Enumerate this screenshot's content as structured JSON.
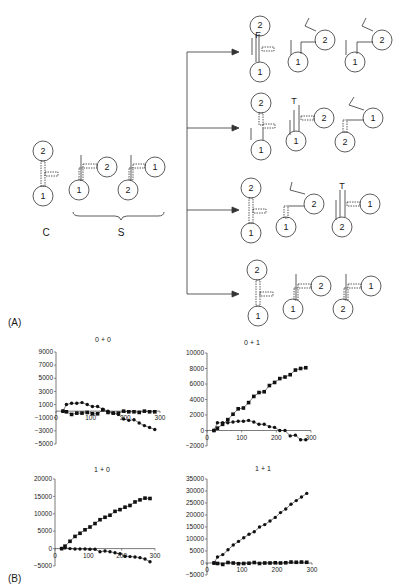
{
  "panel_labels": {
    "a": "(A)",
    "b": "(B)"
  },
  "diagram": {
    "left_labels": {
      "c": "C",
      "s": "S"
    },
    "node_labels": {
      "one": "1",
      "two": "2"
    },
    "markers": {
      "f": "F",
      "t": "T"
    }
  },
  "chart_data": [
    {
      "type": "scatter",
      "title": "0 + 0",
      "xlim": [
        0,
        300
      ],
      "ylim": [
        -5000,
        9000
      ],
      "xticks": [
        0,
        100,
        200,
        300
      ],
      "yticks": [
        9000,
        7000,
        5000,
        3000,
        1000,
        -1000,
        -3000,
        -5000
      ],
      "series": [
        {
          "name": "squares",
          "marker": "square",
          "x": [
            20,
            30,
            45,
            60,
            75,
            90,
            105,
            120,
            135,
            150,
            165,
            180,
            195,
            210,
            225,
            240,
            255,
            270,
            285
          ],
          "y": [
            0,
            -100,
            -500,
            -300,
            -300,
            -200,
            -400,
            -400,
            200,
            -200,
            -300,
            -300,
            0,
            -100,
            -100,
            -200,
            0,
            -100,
            -100
          ]
        },
        {
          "name": "circles",
          "marker": "circle",
          "x": [
            20,
            30,
            45,
            60,
            75,
            90,
            105,
            120,
            135,
            150,
            165,
            180,
            195,
            210,
            225,
            240,
            255,
            270,
            285
          ],
          "y": [
            0,
            1000,
            1200,
            1200,
            1300,
            1000,
            700,
            700,
            300,
            0,
            -300,
            -500,
            -1200,
            -1400,
            -1300,
            -1800,
            -2200,
            -2500,
            -2800
          ]
        }
      ]
    },
    {
      "type": "scatter",
      "title": "0 + 1",
      "xlim": [
        0,
        300
      ],
      "ylim": [
        -2000,
        10000
      ],
      "xticks": [
        0,
        100,
        200,
        300
      ],
      "yticks": [
        10000,
        8000,
        6000,
        4000,
        2000,
        0,
        -2000
      ],
      "series": [
        {
          "name": "squares",
          "marker": "square",
          "x": [
            20,
            30,
            45,
            60,
            75,
            90,
            105,
            120,
            135,
            150,
            165,
            180,
            195,
            210,
            225,
            240,
            255,
            270,
            285
          ],
          "y": [
            0,
            300,
            800,
            1400,
            2100,
            2800,
            2900,
            3600,
            4400,
            4900,
            5000,
            5800,
            6200,
            6700,
            6900,
            7200,
            7800,
            8000,
            8100
          ]
        },
        {
          "name": "circles",
          "marker": "circle",
          "x": [
            20,
            30,
            45,
            60,
            75,
            90,
            105,
            120,
            135,
            150,
            165,
            180,
            195,
            210,
            225,
            240,
            255,
            270,
            285
          ],
          "y": [
            0,
            1000,
            1000,
            1000,
            1100,
            1200,
            1200,
            1300,
            1100,
            800,
            800,
            500,
            400,
            0,
            0,
            -700,
            -600,
            -1200,
            -1200
          ]
        }
      ]
    },
    {
      "type": "scatter",
      "title": "1 + 0",
      "xlim": [
        0,
        300
      ],
      "ylim": [
        -5000,
        20000
      ],
      "xticks": [
        0,
        100,
        200,
        300
      ],
      "yticks": [
        20000,
        15000,
        10000,
        5000,
        0,
        -5000
      ],
      "series": [
        {
          "name": "squares",
          "marker": "square",
          "x": [
            20,
            30,
            45,
            60,
            75,
            90,
            105,
            120,
            135,
            150,
            165,
            180,
            195,
            210,
            225,
            240,
            255,
            270,
            285
          ],
          "y": [
            0,
            700,
            2100,
            3500,
            4400,
            5400,
            6200,
            7200,
            8300,
            9000,
            9600,
            10700,
            11200,
            11900,
            12400,
            13400,
            14000,
            14500,
            14400
          ]
        },
        {
          "name": "circles",
          "marker": "circle",
          "x": [
            20,
            30,
            45,
            60,
            75,
            90,
            105,
            120,
            135,
            150,
            165,
            180,
            195,
            210,
            225,
            240,
            255,
            270,
            285
          ],
          "y": [
            0,
            200,
            0,
            -100,
            -100,
            -100,
            -200,
            -200,
            -900,
            -700,
            -900,
            -1200,
            -1500,
            -2200,
            -2300,
            -2400,
            -2600,
            -3000,
            -3800
          ]
        }
      ]
    },
    {
      "type": "scatter",
      "title": "1 + 1",
      "xlim": [
        0,
        300
      ],
      "ylim": [
        -5000,
        35000
      ],
      "xticks": [
        0,
        100,
        200,
        300
      ],
      "yticks": [
        35000,
        30000,
        25000,
        20000,
        15000,
        10000,
        5000,
        0,
        -5000
      ],
      "series": [
        {
          "name": "circles",
          "marker": "circle",
          "x": [
            20,
            30,
            45,
            60,
            75,
            90,
            105,
            120,
            135,
            150,
            165,
            180,
            195,
            210,
            225,
            240,
            255,
            270,
            285
          ],
          "y": [
            0,
            2500,
            3500,
            5500,
            7500,
            9000,
            10500,
            12000,
            13000,
            15000,
            16000,
            17500,
            19000,
            21000,
            22500,
            24500,
            26000,
            27500,
            29000
          ]
        },
        {
          "name": "squares",
          "marker": "square",
          "x": [
            20,
            30,
            45,
            60,
            75,
            90,
            105,
            120,
            135,
            150,
            165,
            180,
            195,
            210,
            225,
            240,
            255,
            270,
            285
          ],
          "y": [
            0,
            -200,
            -600,
            200,
            0,
            -300,
            -200,
            -100,
            200,
            -200,
            0,
            0,
            100,
            0,
            100,
            400,
            300,
            400,
            300
          ]
        }
      ]
    }
  ]
}
